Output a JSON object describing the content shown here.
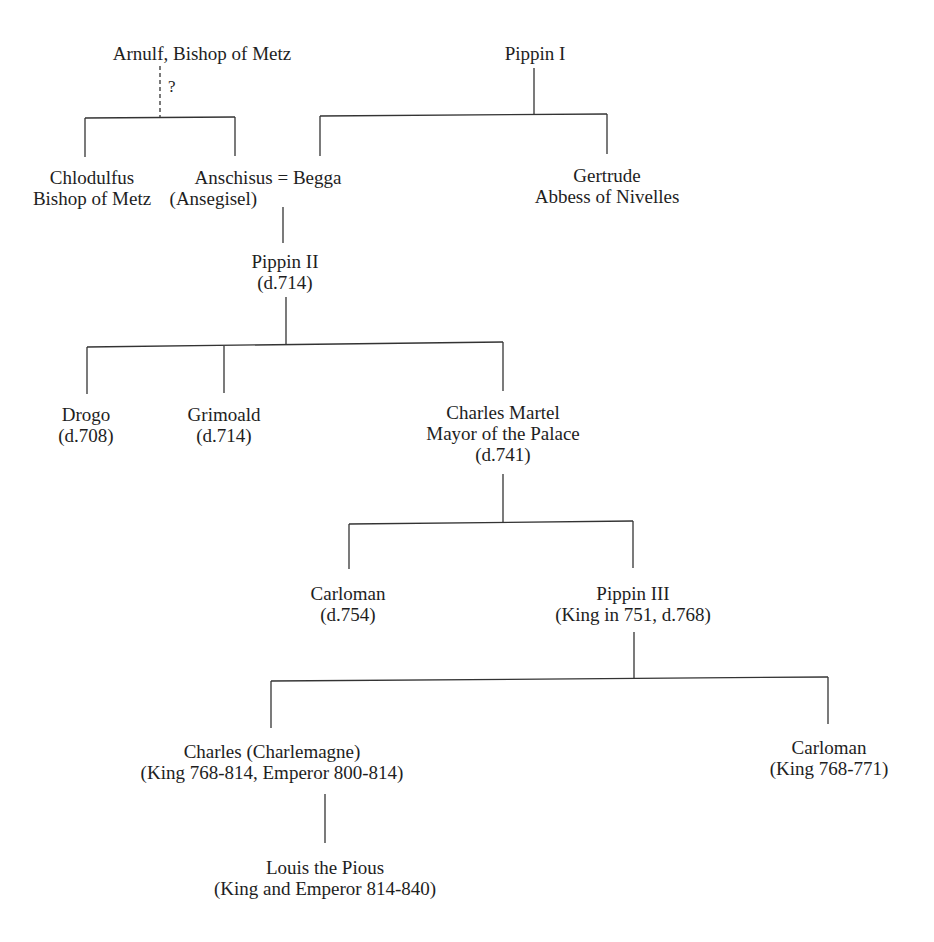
{
  "diagram": {
    "type": "genealogy-tree",
    "line_color": "#333333",
    "uncertain_marker": "?",
    "nodes": {
      "arnulf": {
        "lines": [
          "Arnulf, Bishop of Metz"
        ]
      },
      "pippin1": {
        "lines": [
          "Pippin I"
        ]
      },
      "chlodulfus": {
        "lines": [
          "Chlodulfus",
          "Bishop of Metz"
        ]
      },
      "anschisus": {
        "lines": [
          "Anschisus = Begga",
          "(Ansegisel)"
        ]
      },
      "gertrude": {
        "lines": [
          "Gertrude",
          "Abbess of Nivelles"
        ]
      },
      "pippin2": {
        "lines": [
          "Pippin II",
          "(d.714)"
        ]
      },
      "drogo": {
        "lines": [
          "Drogo",
          "(d.708)"
        ]
      },
      "grimoald": {
        "lines": [
          "Grimoald",
          "(d.714)"
        ]
      },
      "charles_martel": {
        "lines": [
          "Charles Martel",
          "Mayor of the Palace",
          "(d.741)"
        ]
      },
      "carloman1": {
        "lines": [
          "Carloman",
          "(d.754)"
        ]
      },
      "pippin3": {
        "lines": [
          "Pippin III",
          "(King in 751, d.768)"
        ]
      },
      "charlemagne": {
        "lines": [
          "Charles (Charlemagne)",
          "(King 768-814, Emperor 800-814)"
        ]
      },
      "carloman2": {
        "lines": [
          "Carloman",
          "(King 768-771)"
        ]
      },
      "louis": {
        "lines": [
          "Louis the Pious",
          "(King and Emperor 814-840)"
        ]
      }
    },
    "relations": [
      {
        "parent": "arnulf",
        "children": [
          "chlodulfus",
          "anschisus"
        ],
        "uncertain": true
      },
      {
        "parent": "pippin1",
        "children": [
          "anschisus",
          "gertrude"
        ],
        "via": "Begga"
      },
      {
        "parent": "anschisus",
        "children": [
          "pippin2"
        ]
      },
      {
        "parent": "pippin2",
        "children": [
          "drogo",
          "grimoald",
          "charles_martel"
        ]
      },
      {
        "parent": "charles_martel",
        "children": [
          "carloman1",
          "pippin3"
        ]
      },
      {
        "parent": "pippin3",
        "children": [
          "charlemagne",
          "carloman2"
        ]
      },
      {
        "parent": "charlemagne",
        "children": [
          "louis"
        ]
      }
    ]
  }
}
